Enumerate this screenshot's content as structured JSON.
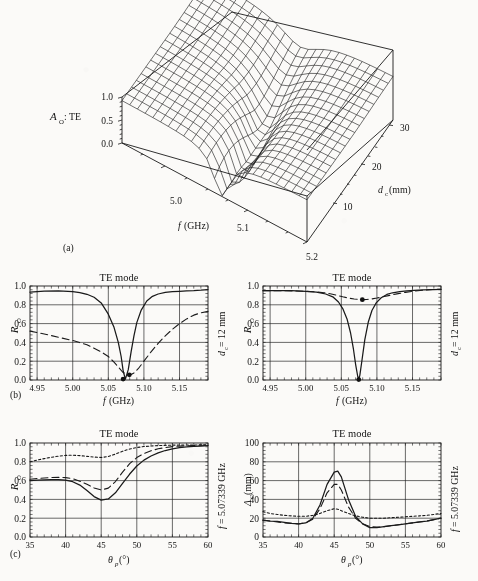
{
  "figure": {
    "panel_labels": [
      "(a)",
      "(b)",
      "(c)"
    ]
  },
  "panel_a": {
    "type": "surface3d",
    "zlabel": "A",
    "zlabel_sub": "O",
    "zlabel_tail": ": TE",
    "zticks": [
      "1.0",
      "0.5",
      "0.0"
    ],
    "zlim": [
      0.0,
      1.0
    ],
    "xlabel": "f",
    "xlabel_unit": "(GHz)",
    "xticks": [
      "5.0",
      "5.1",
      "5.2"
    ],
    "xlim": [
      4.95,
      5.2
    ],
    "ylabel": "d",
    "ylabel_sub": "c",
    "ylabel_unit": "(mm)",
    "yticks": [
      "10",
      "20",
      "30"
    ],
    "ylim": [
      5,
      32
    ],
    "caption": "(a)"
  },
  "panel_b_left": {
    "title": "TE mode",
    "ylabel": "R",
    "ylabel_sub": "O",
    "yticks": [
      "1.0",
      "0.8",
      "0.6",
      "0.4",
      "0.2",
      "0.0"
    ],
    "ylim": [
      0.0,
      1.0
    ],
    "xlabel": "f",
    "xlabel_unit": "(GHz)",
    "xticks": [
      "4.95",
      "5.00",
      "5.05",
      "5.10",
      "5.15"
    ],
    "xlim": [
      4.94,
      5.19
    ],
    "right_label": "d",
    "right_label_sub": "c",
    "right_label_tail": " = 12 mm",
    "marker_points": [
      {
        "x": 5.0708,
        "y": 0.01
      },
      {
        "x": 5.0795,
        "y": 0.055
      }
    ],
    "chart_data": {
      "type": "line",
      "title": "TE mode",
      "xlabel": "f (GHz)",
      "ylabel": "R_O",
      "xlim": [
        4.94,
        5.19
      ],
      "ylim": [
        0.0,
        1.0
      ],
      "grid": true,
      "series": [
        {
          "name": "solid",
          "style": "solid",
          "x": [
            4.94,
            4.96,
            4.98,
            5.0,
            5.01,
            5.02,
            5.03,
            5.04,
            5.05,
            5.058,
            5.064,
            5.068,
            5.071,
            5.074,
            5.078,
            5.082,
            5.086,
            5.09,
            5.096,
            5.104,
            5.112,
            5.12,
            5.13,
            5.14,
            5.15,
            5.16,
            5.17,
            5.18,
            5.19
          ],
          "y": [
            0.935,
            0.945,
            0.948,
            0.94,
            0.93,
            0.912,
            0.88,
            0.82,
            0.7,
            0.56,
            0.4,
            0.25,
            0.09,
            0.01,
            0.11,
            0.3,
            0.47,
            0.61,
            0.74,
            0.84,
            0.89,
            0.915,
            0.932,
            0.94,
            0.944,
            0.947,
            0.95,
            0.955,
            0.962
          ]
        },
        {
          "name": "dashed",
          "style": "dashed",
          "x": [
            4.94,
            4.96,
            4.98,
            5.0,
            5.02,
            5.04,
            5.05,
            5.058,
            5.064,
            5.07,
            5.076,
            5.08,
            5.086,
            5.092,
            5.1,
            5.11,
            5.12,
            5.13,
            5.14,
            5.15,
            5.16,
            5.17,
            5.18,
            5.19
          ],
          "y": [
            0.52,
            0.49,
            0.455,
            0.42,
            0.375,
            0.3,
            0.25,
            0.19,
            0.14,
            0.085,
            0.055,
            0.05,
            0.075,
            0.12,
            0.2,
            0.3,
            0.39,
            0.47,
            0.54,
            0.6,
            0.65,
            0.69,
            0.715,
            0.73
          ]
        }
      ]
    }
  },
  "panel_b_right": {
    "title": "TE mode",
    "ylabel": "R",
    "ylabel_sub": "O",
    "yticks": [
      "1.0",
      "0.8",
      "0.6",
      "0.4",
      "0.2",
      "0.0"
    ],
    "ylim": [
      0.0,
      1.0
    ],
    "xlabel": "f",
    "xlabel_unit": "(GHz)",
    "xticks": [
      "4.95",
      "5.00",
      "5.05",
      "5.10",
      "5.15"
    ],
    "xlim": [
      4.94,
      5.19
    ],
    "right_label": "d",
    "right_label_sub": "c",
    "right_label_tail": " = 12 mm",
    "marker_points": [
      {
        "x": 5.0745,
        "y": 0.005
      },
      {
        "x": 5.0795,
        "y": 0.855
      }
    ],
    "chart_data": {
      "type": "line",
      "title": "TE mode",
      "xlabel": "f (GHz)",
      "ylabel": "R_O",
      "xlim": [
        4.94,
        5.19
      ],
      "ylim": [
        0.0,
        1.0
      ],
      "grid": true,
      "series": [
        {
          "name": "solid",
          "style": "solid",
          "x": [
            4.94,
            4.96,
            4.98,
            5.0,
            5.015,
            5.028,
            5.038,
            5.046,
            5.052,
            5.058,
            5.063,
            5.067,
            5.07,
            5.073,
            5.0745,
            5.076,
            5.079,
            5.083,
            5.088,
            5.093,
            5.099,
            5.106,
            5.114,
            5.122,
            5.132,
            5.142,
            5.152,
            5.165,
            5.18,
            5.19
          ],
          "y": [
            0.95,
            0.952,
            0.95,
            0.944,
            0.935,
            0.915,
            0.885,
            0.83,
            0.76,
            0.65,
            0.5,
            0.33,
            0.17,
            0.04,
            0.005,
            0.05,
            0.21,
            0.43,
            0.62,
            0.74,
            0.82,
            0.875,
            0.91,
            0.928,
            0.94,
            0.948,
            0.953,
            0.958,
            0.962,
            0.965
          ]
        },
        {
          "name": "dashed",
          "style": "dashed",
          "x": [
            4.94,
            4.96,
            4.98,
            5.0,
            5.014,
            5.026,
            5.036,
            5.044,
            5.052,
            5.06,
            5.068,
            5.074,
            5.08,
            5.086,
            5.093,
            5.1,
            5.108,
            5.118,
            5.128,
            5.14,
            5.152,
            5.165,
            5.178,
            5.19
          ],
          "y": [
            0.95,
            0.95,
            0.948,
            0.944,
            0.938,
            0.928,
            0.915,
            0.9,
            0.885,
            0.872,
            0.862,
            0.857,
            0.855,
            0.857,
            0.863,
            0.872,
            0.884,
            0.9,
            0.916,
            0.932,
            0.945,
            0.955,
            0.962,
            0.966
          ]
        }
      ]
    }
  },
  "panel_c_left": {
    "title": "TE mode",
    "ylabel": "R",
    "ylabel_sub": "O",
    "yticks": [
      "1.0",
      "0.8",
      "0.6",
      "0.4",
      "0.2",
      "0.0"
    ],
    "ylim": [
      0.0,
      1.0
    ],
    "xlabel": "θ",
    "xlabel_sub": "p",
    "xlabel_unit": "(°)",
    "xticks": [
      "35",
      "40",
      "45",
      "50",
      "55",
      "60"
    ],
    "xlim": [
      35,
      60
    ],
    "right_label": "f",
    "right_label_tail": " = 5.07339 GHz",
    "chart_data": {
      "type": "line",
      "title": "TE mode",
      "xlabel": "theta_p (deg)",
      "ylabel": "R_O",
      "xlim": [
        35,
        60
      ],
      "ylim": [
        0.0,
        1.0
      ],
      "grid": true,
      "series": [
        {
          "name": "dotted",
          "style": "dotted",
          "x": [
            35,
            36,
            37,
            38,
            39,
            40,
            41,
            42,
            43,
            44,
            45,
            46,
            47,
            48,
            49,
            50,
            51,
            52,
            53,
            54,
            55,
            56,
            57,
            58,
            59,
            60
          ],
          "y": [
            0.8,
            0.818,
            0.834,
            0.848,
            0.86,
            0.868,
            0.87,
            0.866,
            0.858,
            0.85,
            0.846,
            0.856,
            0.882,
            0.912,
            0.936,
            0.952,
            0.962,
            0.968,
            0.972,
            0.975,
            0.977,
            0.978,
            0.979,
            0.979,
            0.98,
            0.98
          ]
        },
        {
          "name": "dashed",
          "style": "dashed",
          "x": [
            35,
            36,
            37,
            38,
            39,
            40,
            41,
            42,
            43,
            44,
            45,
            46,
            47,
            48,
            49,
            50,
            51,
            52,
            53,
            54,
            55,
            56,
            57,
            58,
            59,
            60
          ],
          "y": [
            0.615,
            0.622,
            0.628,
            0.632,
            0.634,
            0.632,
            0.62,
            0.594,
            0.56,
            0.522,
            0.5,
            0.52,
            0.59,
            0.69,
            0.78,
            0.845,
            0.888,
            0.918,
            0.938,
            0.952,
            0.961,
            0.967,
            0.971,
            0.974,
            0.976,
            0.977
          ]
        },
        {
          "name": "solid",
          "style": "solid",
          "x": [
            35,
            36,
            37,
            38,
            39,
            40,
            41,
            42,
            43,
            44,
            45,
            46,
            47,
            48,
            49,
            50,
            51,
            52,
            53,
            54,
            55,
            56,
            57,
            58,
            59,
            60
          ],
          "y": [
            0.6,
            0.604,
            0.608,
            0.61,
            0.61,
            0.605,
            0.588,
            0.552,
            0.495,
            0.43,
            0.392,
            0.405,
            0.47,
            0.57,
            0.67,
            0.755,
            0.818,
            0.862,
            0.895,
            0.92,
            0.938,
            0.95,
            0.958,
            0.964,
            0.968,
            0.972
          ]
        }
      ]
    }
  },
  "panel_c_right": {
    "title": "TE mode",
    "ylabel": "Δ",
    "ylabel_sub": "O",
    "ylabel_unit": "(mm)",
    "yticks": [
      "100",
      "80",
      "60",
      "40",
      "20",
      "0"
    ],
    "ylim": [
      0,
      100
    ],
    "xlabel": "θ",
    "xlabel_sub": "p",
    "xlabel_unit": "(°)",
    "xticks": [
      "35",
      "40",
      "45",
      "50",
      "55",
      "60"
    ],
    "xlim": [
      35,
      60
    ],
    "right_label": "f",
    "right_label_tail": " = 5.07339 GHz",
    "chart_data": {
      "type": "line",
      "title": "TE mode",
      "xlabel": "theta_p (deg)",
      "ylabel": "Delta_O (mm)",
      "xlim": [
        35,
        60
      ],
      "ylim": [
        0,
        100
      ],
      "grid": true,
      "series": [
        {
          "name": "dotted",
          "style": "dotted",
          "x": [
            35,
            36,
            37,
            38,
            39,
            40,
            41,
            42,
            43,
            44,
            45,
            45.5,
            46,
            47,
            48,
            49,
            50,
            51,
            52,
            53,
            54,
            55,
            56,
            57,
            58,
            59,
            60
          ],
          "y": [
            27,
            25,
            24,
            23,
            22.5,
            22,
            22,
            23,
            25,
            28,
            30,
            29.5,
            28,
            25,
            22.5,
            21,
            20,
            20,
            20,
            20.5,
            21,
            21.5,
            22,
            22.5,
            23,
            24,
            25
          ]
        },
        {
          "name": "dashed",
          "style": "dashed",
          "x": [
            35,
            36,
            37,
            38,
            39,
            40,
            41,
            42,
            43,
            44,
            45,
            45.5,
            46,
            47,
            48,
            49,
            50,
            51,
            52,
            53,
            54,
            55,
            56,
            57,
            58,
            59,
            60
          ],
          "y": [
            18,
            17,
            16,
            15,
            14.5,
            14,
            15,
            19,
            30,
            47,
            56,
            56,
            50,
            32,
            20,
            14,
            11,
            10.5,
            11,
            12,
            13,
            14,
            15,
            16,
            17,
            18.5,
            20
          ]
        },
        {
          "name": "solid",
          "style": "solid",
          "x": [
            35,
            36,
            37,
            38,
            39,
            40,
            41,
            42,
            43,
            44,
            45,
            45.5,
            46,
            47,
            48,
            49,
            50,
            51,
            52,
            53,
            54,
            55,
            56,
            57,
            58,
            59,
            60
          ],
          "y": [
            18,
            17,
            16.5,
            15.5,
            14.5,
            14,
            15,
            20,
            34,
            56,
            69,
            70,
            64,
            40,
            22,
            14,
            10,
            10,
            11,
            12,
            13,
            14,
            15,
            16,
            17,
            18.5,
            20
          ]
        }
      ]
    }
  }
}
